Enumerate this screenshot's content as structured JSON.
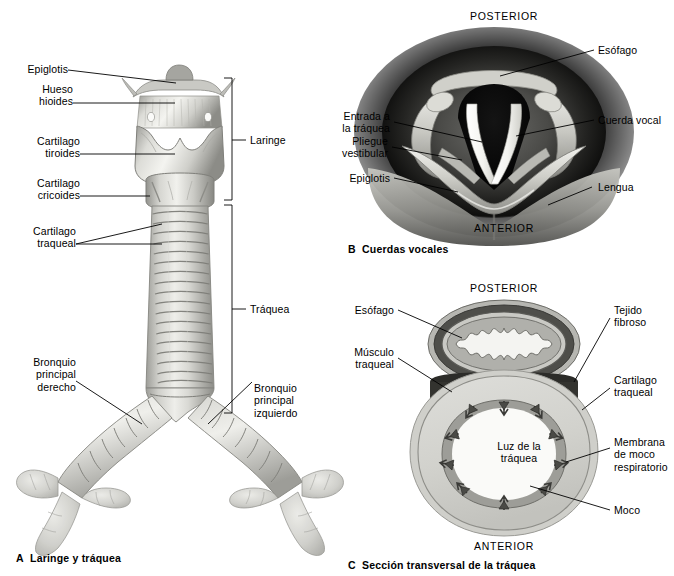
{
  "figure": {
    "language": "es",
    "background_color": "#ffffff",
    "ink_color": "#000000"
  },
  "panels": [
    {
      "id": "A",
      "letter": "A",
      "caption": "Laringe y tráquea",
      "view": "vista anterior de laringe, tráquea y bronquios principales",
      "labels": [
        {
          "key": "epiglotis",
          "text": "Epiglotis",
          "side": "left"
        },
        {
          "key": "hueso_hioides",
          "text": "Hueso\nhioides",
          "side": "left"
        },
        {
          "key": "cartilago_tiroides",
          "text": "Cartilago\ntiroides",
          "side": "left"
        },
        {
          "key": "cartilago_cricoides",
          "text": "Cartilago\ncricoides",
          "side": "left"
        },
        {
          "key": "cartilago_traqueal",
          "text": "Cartilago\ntraqueal",
          "side": "left"
        },
        {
          "key": "bronquio_derecho",
          "text": "Bronquio\nprincipal\nderecho",
          "side": "left"
        },
        {
          "key": "bronquio_izquierdo",
          "text": "Bronquio\nprincipal\nizquierdo",
          "side": "right"
        }
      ],
      "brackets": [
        {
          "key": "laringe",
          "text": "Laringe"
        },
        {
          "key": "traquea",
          "text": "Tráquea"
        }
      ]
    },
    {
      "id": "B",
      "letter": "B",
      "caption": "Cuerdas vocales",
      "view": "vista laringoscópica superior de la glotis",
      "orientation": {
        "top": "POSTERIOR",
        "bottom": "ANTERIOR"
      },
      "labels": [
        {
          "key": "esofago",
          "text": "Esófago",
          "side": "right"
        },
        {
          "key": "cuerda_vocal",
          "text": "Cuerda vocal",
          "side": "right"
        },
        {
          "key": "lengua",
          "text": "Lengua",
          "side": "right"
        },
        {
          "key": "entrada_traquea",
          "text": "Entrada a\nla tráquea",
          "side": "left"
        },
        {
          "key": "pliegue_vestibular",
          "text": "Pliegue\nvestibular",
          "side": "left"
        },
        {
          "key": "epiglotis",
          "text": "Epiglotis",
          "side": "left"
        }
      ]
    },
    {
      "id": "C",
      "letter": "C",
      "caption": "Sección transversal de la tráquea",
      "view": "corte transversal de tráquea y esófago",
      "orientation": {
        "top": "POSTERIOR",
        "bottom": "ANTERIOR"
      },
      "inner_label": "Luz de la\ntráquea",
      "labels": [
        {
          "key": "esofago",
          "text": "Esófago",
          "side": "left"
        },
        {
          "key": "musculo_traqueal",
          "text": "Músculo\ntraqueal",
          "side": "left"
        },
        {
          "key": "tejido_fibroso",
          "text": "Tejido\nfibroso",
          "side": "right"
        },
        {
          "key": "cartilago_traqueal",
          "text": "Cartilago\ntraqueal",
          "side": "right"
        },
        {
          "key": "membrana_moco",
          "text": "Membrana\nde moco\nrespiratorio",
          "side": "right"
        },
        {
          "key": "moco",
          "text": "Moco",
          "side": "right"
        }
      ]
    }
  ],
  "palette": {
    "cartilage_light": "#d8d8d4",
    "cartilage_mid": "#b9b9b4",
    "cartilage_dark": "#8e8e89",
    "mucosa": "#6e6e6a",
    "muscle_dark": "#3a3a38",
    "lumen": "#f2f2f0",
    "glottis_black": "#0b0b0b",
    "cord_white": "#f6f6f4",
    "vignette": "#1a1a1a"
  }
}
